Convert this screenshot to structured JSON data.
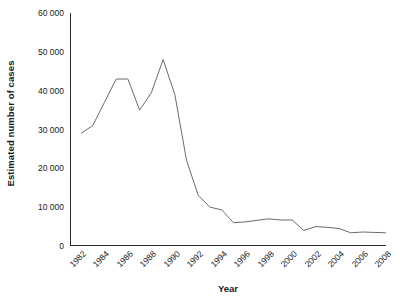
{
  "chart_data": {
    "type": "line",
    "title": "",
    "xlabel": "Year",
    "ylabel": "Estimated number of cases",
    "xlim": [
      1982,
      2008
    ],
    "ylim": [
      0,
      60000
    ],
    "grid": false,
    "legend": null,
    "y_tick_labels": [
      "60 000",
      "50 000",
      "40 000",
      "30 000",
      "20 000",
      "10 000",
      "0"
    ],
    "y_tick_values": [
      60000,
      50000,
      40000,
      30000,
      20000,
      10000,
      0
    ],
    "x_tick_labels": [
      "1982",
      "1984",
      "1986",
      "1988",
      "1990",
      "1992",
      "1994",
      "1996",
      "1998",
      "2000",
      "2002",
      "2004",
      "2006",
      "2008"
    ],
    "x_tick_values": [
      1982,
      1984,
      1986,
      1988,
      1990,
      1992,
      1994,
      1996,
      1998,
      2000,
      2002,
      2004,
      2006,
      2008
    ],
    "x_minor_ticks_every": 1,
    "line_color": "#6b6b6b",
    "x": [
      1982,
      1983,
      1984,
      1985,
      1986,
      1987,
      1988,
      1989,
      1990,
      1991,
      1992,
      1993,
      1994,
      1995,
      1996,
      1997,
      1998,
      1999,
      2000,
      2001,
      2002,
      2003,
      2004,
      2005,
      2006,
      2007,
      2008
    ],
    "values": [
      29000,
      31000,
      37000,
      43000,
      43000,
      35000,
      39500,
      48000,
      39000,
      22000,
      13000,
      10000,
      9300,
      6000,
      6200,
      6600,
      7000,
      6700,
      6700,
      4000,
      5000,
      4800,
      4500,
      3400,
      3600,
      3500,
      3400
    ],
    "series": [
      {
        "name": "Estimated number of cases",
        "values": [
          29000,
          31000,
          37000,
          43000,
          43000,
          35000,
          39500,
          48000,
          39000,
          22000,
          13000,
          10000,
          9300,
          6000,
          6200,
          6600,
          7000,
          6700,
          6700,
          4000,
          5000,
          4800,
          4500,
          3400,
          3600,
          3500,
          3400
        ]
      }
    ]
  }
}
